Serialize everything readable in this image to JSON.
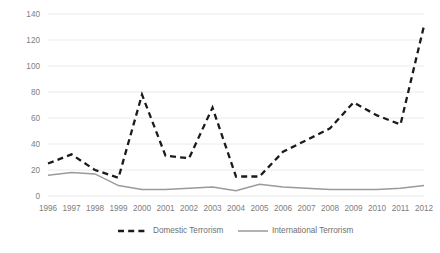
{
  "chart_data": {
    "type": "line",
    "title": "",
    "xlabel": "",
    "ylabel": "",
    "grid": true,
    "legend_position": "bottom",
    "ylim": [
      0,
      140
    ],
    "yticks": [
      0,
      20,
      40,
      60,
      80,
      100,
      120,
      140
    ],
    "categories": [
      "1996",
      "1997",
      "1998",
      "1999",
      "2000",
      "2001",
      "2002",
      "2003",
      "2004",
      "2005",
      "2006",
      "2007",
      "2008",
      "2009",
      "2010",
      "2011",
      "2012"
    ],
    "series": [
      {
        "name": "Domestic Terrorism",
        "style": "dashed",
        "color": "#1b1b1b",
        "values": [
          25,
          32,
          20,
          14,
          78,
          31,
          29,
          68,
          15,
          15,
          34,
          43,
          52,
          72,
          62,
          55,
          131
        ]
      },
      {
        "name": "International Terrorism",
        "style": "solid",
        "color": "#9a9a9a",
        "values": [
          16,
          18,
          17,
          8,
          5,
          5,
          6,
          7,
          4,
          9,
          7,
          6,
          5,
          5,
          5,
          6,
          8
        ]
      }
    ]
  },
  "legend": {
    "items": [
      {
        "label": "Domestic Terrorism"
      },
      {
        "label": "International Terrorism"
      }
    ]
  }
}
